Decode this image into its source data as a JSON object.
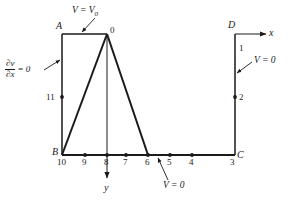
{
  "figure": {
    "title_present": false,
    "stroke_color": "#1a1a1a",
    "background_color": "#ffffff",
    "corners": {
      "a": "A",
      "b": "B",
      "c": "C",
      "d": "D"
    },
    "axes": {
      "x_label": "x",
      "y_label": "y"
    },
    "apex_label": "0",
    "boundary_conditions": {
      "top": "V = V",
      "top_sub": "0",
      "left_numerator": "∂v",
      "left_denominator": "∂x",
      "left_equals": "= 0",
      "right": "V = 0",
      "bottom": "V = 0"
    },
    "nodes": [
      {
        "id": "10",
        "label": "10",
        "x": 62,
        "y": 155,
        "label_x": 57,
        "label_y": 158,
        "dot": false
      },
      {
        "id": "9",
        "label": "9",
        "x": 85,
        "y": 155,
        "label_x": 82,
        "label_y": 158,
        "dot": true
      },
      {
        "id": "8",
        "label": "8",
        "x": 107,
        "y": 155,
        "label_x": 104,
        "label_y": 158,
        "dot": true
      },
      {
        "id": "7",
        "label": "7",
        "x": 126,
        "y": 155,
        "label_x": 123,
        "label_y": 158,
        "dot": true
      },
      {
        "id": "6",
        "label": "6",
        "x": 148,
        "y": 155,
        "label_x": 145,
        "label_y": 158,
        "dot": true
      },
      {
        "id": "5",
        "label": "5",
        "x": 170,
        "y": 155,
        "label_x": 167,
        "label_y": 158,
        "dot": true
      },
      {
        "id": "4",
        "label": "4",
        "x": 192,
        "y": 155,
        "label_x": 189,
        "label_y": 158,
        "dot": true
      },
      {
        "id": "3",
        "label": "3",
        "x": 235,
        "y": 155,
        "label_x": 230,
        "label_y": 158,
        "dot": false
      },
      {
        "id": "11",
        "label": "11",
        "x": 62,
        "y": 97,
        "label_x": 46,
        "label_y": 93,
        "dot": true
      },
      {
        "id": "1",
        "label": "1",
        "x": 235,
        "y": 48,
        "label_x": 239,
        "label_y": 44,
        "dot": false
      },
      {
        "id": "2",
        "label": "2",
        "x": 235,
        "y": 97,
        "label_x": 239,
        "label_y": 93,
        "dot": true
      }
    ]
  }
}
